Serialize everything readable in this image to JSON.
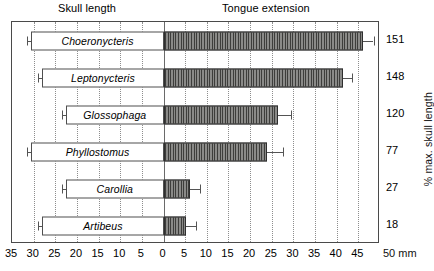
{
  "figure": {
    "left_panel_title": "Skull length",
    "right_panel_title": "Tongue extension",
    "right_axis_title": "% max. skull length",
    "x_unit_label": "50 mm"
  },
  "chart_data": {
    "type": "bar",
    "orientation": "horizontal",
    "xlabel": "mm",
    "ylabel": "",
    "grid": true,
    "legend": null,
    "axis": {
      "tick_labels": [
        "35",
        "30",
        "25",
        "20",
        "15",
        "10",
        "5",
        "0",
        "5",
        "10",
        "15",
        "20",
        "25",
        "30",
        "35",
        "40",
        "45",
        "50 mm"
      ],
      "tick_values_mm": [
        -35,
        -30,
        -25,
        -20,
        -15,
        -10,
        -5,
        0,
        5,
        10,
        15,
        20,
        25,
        30,
        35,
        40,
        45,
        50
      ],
      "xlim_mm": [
        -35,
        50
      ],
      "zero_at_mm": 0
    },
    "categories": [
      "Choeronycteris",
      "Leptonycteris",
      "Glossophaga",
      "Phyllostomus",
      "Carollia",
      "Artibeus"
    ],
    "series": [
      {
        "name": "Skull length",
        "direction": "left",
        "unit": "mm",
        "values": [
          30.5,
          28.0,
          22.5,
          30.5,
          22.5,
          28.0
        ],
        "error_low": [
          31.5,
          29.0,
          23.5,
          31.5,
          23.5,
          29.0
        ]
      },
      {
        "name": "Tongue extension",
        "direction": "right",
        "unit": "mm",
        "values": [
          46.0,
          41.5,
          26.5,
          24.0,
          6.2,
          5.3
        ],
        "error_high": [
          48.5,
          43.5,
          29.5,
          27.5,
          8.5,
          7.5
        ]
      }
    ],
    "right_axis": {
      "label": "% max. skull length",
      "values": [
        151,
        148,
        120,
        77,
        27,
        18
      ]
    }
  },
  "rows": [
    {
      "species": "Choeronycteris",
      "skull_mm": 30.5,
      "skull_err_mm": 31.5,
      "tongue_mm": 46.0,
      "tongue_err_mm": 48.5,
      "pct": "151"
    },
    {
      "species": "Leptonycteris",
      "skull_mm": 28.0,
      "skull_err_mm": 29.0,
      "tongue_mm": 41.5,
      "tongue_err_mm": 43.5,
      "pct": "148"
    },
    {
      "species": "Glossophaga",
      "skull_mm": 22.5,
      "skull_err_mm": 23.5,
      "tongue_mm": 26.5,
      "tongue_err_mm": 29.5,
      "pct": "120"
    },
    {
      "species": "Phyllostomus",
      "skull_mm": 30.5,
      "skull_err_mm": 31.5,
      "tongue_mm": 24.0,
      "tongue_err_mm": 27.5,
      "pct": "77"
    },
    {
      "species": "Carollia",
      "skull_mm": 22.5,
      "skull_err_mm": 23.5,
      "tongue_mm": 6.2,
      "tongue_err_mm": 8.5,
      "pct": "27"
    },
    {
      "species": "Artibeus",
      "skull_mm": 28.0,
      "skull_err_mm": 29.0,
      "tongue_mm": 5.3,
      "tongue_err_mm": 7.5,
      "pct": "18"
    }
  ],
  "xticks": [
    {
      "label": "35"
    },
    {
      "label": "30"
    },
    {
      "label": "25"
    },
    {
      "label": "20"
    },
    {
      "label": "15"
    },
    {
      "label": "10"
    },
    {
      "label": "5"
    },
    {
      "label": "0"
    },
    {
      "label": "5"
    },
    {
      "label": "10"
    },
    {
      "label": "15"
    },
    {
      "label": "20"
    },
    {
      "label": "25"
    },
    {
      "label": "30"
    },
    {
      "label": "35"
    },
    {
      "label": "40"
    },
    {
      "label": "45"
    }
  ]
}
